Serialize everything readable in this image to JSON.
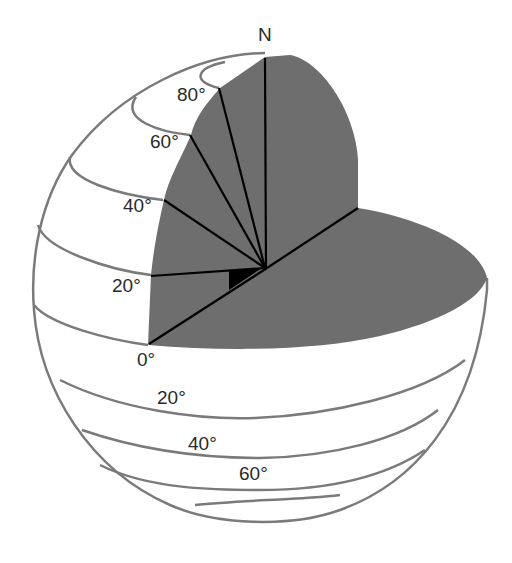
{
  "diagram": {
    "pole_label": "N",
    "colors": {
      "cut_surface": "#6e6e6e",
      "outline": "#7a7a7a",
      "radius_lines": "#000000",
      "angle_marker": "#000000",
      "background": "#ffffff",
      "text": "#2a2a2a"
    },
    "northern_labels": [
      {
        "id": "lat-80",
        "text": "80°"
      },
      {
        "id": "lat-60",
        "text": "60°"
      },
      {
        "id": "lat-40",
        "text": "40°"
      },
      {
        "id": "lat-20",
        "text": "20°"
      },
      {
        "id": "lat-0",
        "text": "0°"
      }
    ],
    "southern_labels": [
      {
        "id": "lat-s20",
        "text": "20°"
      },
      {
        "id": "lat-s40",
        "text": "40°"
      },
      {
        "id": "lat-s60",
        "text": "60°"
      }
    ]
  }
}
